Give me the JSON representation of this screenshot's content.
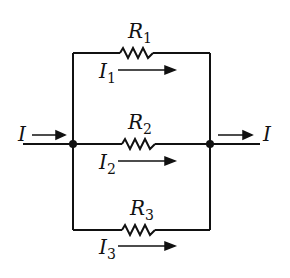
{
  "diagram": {
    "type": "parallel-resistor-circuit",
    "input_current": "I",
    "output_current": "I",
    "branches": [
      {
        "resistor": "R",
        "resistor_sub": "1",
        "current": "I",
        "current_sub": "1"
      },
      {
        "resistor": "R",
        "resistor_sub": "2",
        "current": "I",
        "current_sub": "2"
      },
      {
        "resistor": "R",
        "resistor_sub": "3",
        "current": "I",
        "current_sub": "3"
      }
    ],
    "colors": {
      "line": "#111111",
      "background": "#ffffff"
    }
  }
}
